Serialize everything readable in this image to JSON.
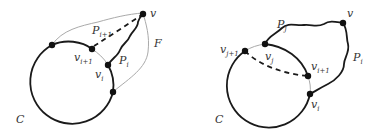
{
  "figure": {
    "left": {
      "cycle_label": "C",
      "face_label": "F",
      "apex_label": "v",
      "path_i": {
        "base": "P",
        "sub": "i"
      },
      "path_i1": {
        "base": "P",
        "sub": "i+1"
      },
      "vertex_i": {
        "base": "v",
        "sub": "i"
      },
      "vertex_i1": {
        "base": "v",
        "sub": "i+1"
      }
    },
    "right": {
      "cycle_label": "C",
      "apex_label": "v",
      "path_i": {
        "base": "P",
        "sub": "i"
      },
      "path_j": {
        "base": "P",
        "sub": "j"
      },
      "vertex_i": {
        "base": "v",
        "sub": "i"
      },
      "vertex_i1": {
        "base": "v",
        "sub": "i+1"
      },
      "vertex_j": {
        "base": "v",
        "sub": "j"
      },
      "vertex_j1": {
        "base": "v",
        "sub": "j+1"
      }
    }
  }
}
